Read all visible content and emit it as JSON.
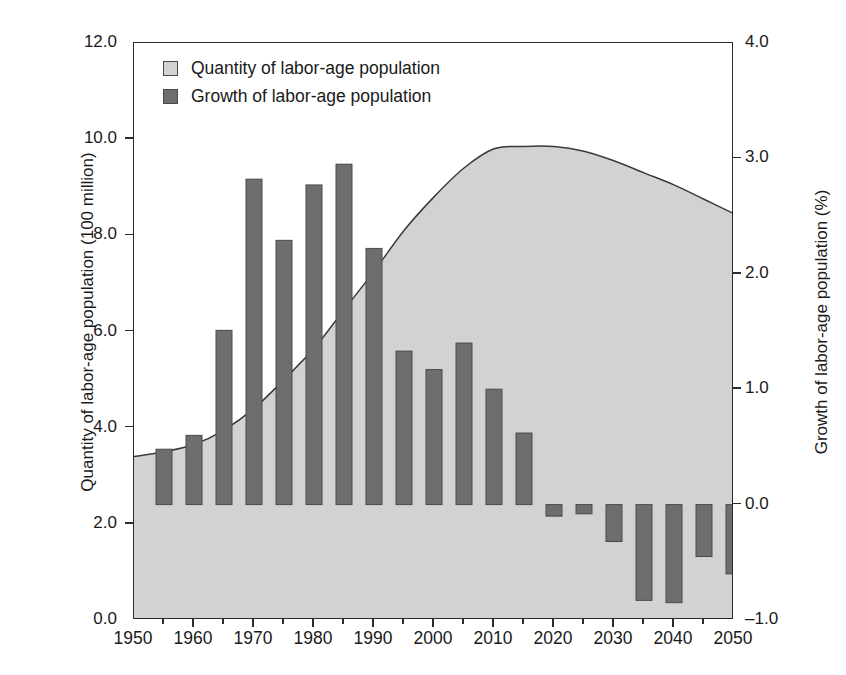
{
  "chart_data": {
    "type": "bar",
    "title": "",
    "subtitle": "",
    "xlabel": "",
    "ylabel": "Quantity of labor-age population (100 million)",
    "y2label": "Growth of labor-age population (%)",
    "xlim": [
      1950,
      2050
    ],
    "ylim": [
      0.0,
      12.0
    ],
    "y2lim": [
      -1.0,
      4.0
    ],
    "grid": false,
    "legend_position": "top-left",
    "x_ticks": [
      "1950",
      "1960",
      "1970",
      "1980",
      "1990",
      "2000",
      "2010",
      "2020",
      "2030",
      "2040",
      "2050"
    ],
    "x_tick_values": [
      1950,
      1960,
      1970,
      1980,
      1990,
      2000,
      2010,
      2020,
      2030,
      2040,
      2050
    ],
    "y_ticks": [
      "0.0",
      "2.0",
      "4.0",
      "6.0",
      "8.0",
      "10.0",
      "12.0"
    ],
    "y_tick_values": [
      0.0,
      2.0,
      4.0,
      6.0,
      8.0,
      10.0,
      12.0
    ],
    "y2_ticks": [
      "-1.0",
      "0.0",
      "1.0",
      "2.0",
      "3.0",
      "4.0"
    ],
    "y2_tick_values": [
      -1.0,
      0.0,
      1.0,
      2.0,
      3.0,
      4.0
    ],
    "legend": [
      {
        "label": "Quantity of labor-age population",
        "color": "#d2d2d2",
        "type": "area"
      },
      {
        "label": "Growth of labor-age population",
        "color": "#6e6e6e",
        "type": "bar"
      }
    ],
    "series": [
      {
        "name": "Quantity of labor-age population",
        "type": "area",
        "axis": "left",
        "unit": "100 million",
        "color": "#d2d2d2",
        "x": [
          1950,
          1955,
          1960,
          1965,
          1970,
          1975,
          1980,
          1985,
          1990,
          1995,
          2000,
          2005,
          2010,
          2015,
          2020,
          2025,
          2030,
          2035,
          2040,
          2045,
          2050
        ],
        "values": [
          3.4,
          3.5,
          3.65,
          3.95,
          4.4,
          5.0,
          5.65,
          6.45,
          7.25,
          8.1,
          8.8,
          9.4,
          9.8,
          9.85,
          9.85,
          9.75,
          9.55,
          9.3,
          9.05,
          8.75,
          8.45
        ]
      },
      {
        "name": "Growth of labor-age population",
        "type": "bar",
        "axis": "right",
        "unit": "%",
        "color": "#6e6e6e",
        "x": [
          1955,
          1960,
          1965,
          1970,
          1975,
          1980,
          1985,
          1990,
          1995,
          2000,
          2005,
          2010,
          2015,
          2020,
          2025,
          2030,
          2035,
          2040,
          2045,
          2050
        ],
        "values": [
          0.48,
          0.6,
          1.51,
          2.82,
          2.29,
          2.77,
          2.95,
          2.22,
          1.33,
          1.17,
          1.4,
          1.0,
          0.62,
          -0.1,
          -0.08,
          -0.32,
          -0.83,
          -0.85,
          -0.45,
          -0.6
        ]
      }
    ]
  },
  "caption": ""
}
